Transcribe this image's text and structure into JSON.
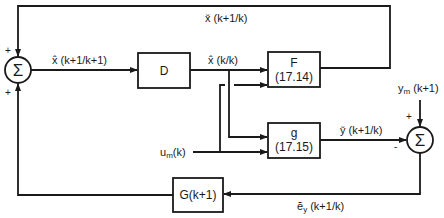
{
  "diagram": {
    "type": "block-diagram",
    "blocks": {
      "D": {
        "label": "D"
      },
      "F": {
        "label": "F",
        "ref": "(17.14)"
      },
      "g": {
        "label": "g",
        "ref": "(17.15)"
      },
      "G": {
        "label": "G(k+1)"
      }
    },
    "summers": {
      "left": {
        "symbol": "Σ",
        "top_sign": "+",
        "bottom_sign": "+"
      },
      "right": {
        "symbol": "Σ",
        "top_sign": "+",
        "left_sign": "-"
      }
    },
    "signals": {
      "x_pred": "x̆ (k+1/k)",
      "x_est_next": "x̂ (k+1/k+1)",
      "x_est": "x̂ (k/k)",
      "y_pred": "y̆ (k+1/k)",
      "y_meas": "y",
      "y_meas_sub": "m",
      "y_meas_arg": " (k+1)",
      "u_meas": "u",
      "u_meas_sub": "m",
      "u_meas_arg": "(k)",
      "e_y": "ĕ",
      "e_y_sub": "y",
      "e_y_arg": " (k+1/k)"
    }
  }
}
